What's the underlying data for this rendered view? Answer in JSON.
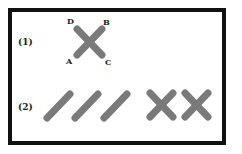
{
  "diagram": {
    "row1": {
      "label": "(1)",
      "points": {
        "A": "A",
        "B": "B",
        "C": "C",
        "D": "D"
      }
    },
    "row2": {
      "label": "(2)",
      "single_sticks": 3,
      "crossed_pairs": 2
    },
    "colors": {
      "stick": "#7a7a7a",
      "border": "#111111"
    }
  }
}
